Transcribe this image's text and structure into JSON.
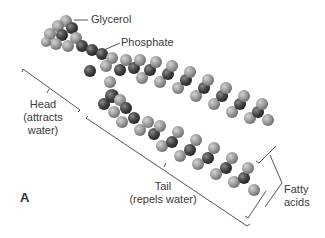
{
  "figure": {
    "panel_label": "A",
    "labels": {
      "glycerol": "Glycerol",
      "phosphate": "Phosphate",
      "head_line1": "Head",
      "head_line2": "(attracts",
      "head_line3": "water)",
      "tail_line1": "Tail",
      "tail_line2": "(repels water)",
      "fatty_line1": "Fatty",
      "fatty_line2": "acids"
    },
    "colors": {
      "background": "#ffffff",
      "hydrogen": "#9a9a9a",
      "carbon": "#3c3c3c",
      "oxygen_phosphate": "#555555",
      "lines": "#555555"
    }
  }
}
